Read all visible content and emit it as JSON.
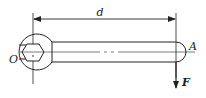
{
  "diagram": {
    "type": "wrench force diagram",
    "labels": {
      "distance": "d",
      "end_point": "A",
      "pivot": "O",
      "force": "F"
    },
    "colors": {
      "stroke": "#222222",
      "background": "#ffffff"
    }
  }
}
